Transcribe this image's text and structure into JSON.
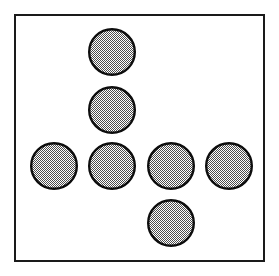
{
  "figure": {
    "title": "Seven shaded circles arranged in a cross pattern",
    "caption": "",
    "width": 279,
    "height": 276,
    "background_color": "#ffffff"
  },
  "frame": {
    "name": "outer-border",
    "x": 14,
    "y": 14,
    "width": 251,
    "height": 248,
    "stroke_color": "#1a1a1a",
    "stroke_width": 2,
    "fill_color": "#ffffff"
  },
  "style": {
    "circle_stroke_color": "#0d0d0d",
    "circle_stroke_width": 2.4,
    "circle_fill_color": "#b8b8b8",
    "circle_fill_pattern": "50-percent-checkerboard-dither",
    "circle_diameter": 48
  },
  "chart_data": {
    "type": "scatter",
    "title": "Seven shaded circles arranged in a cross pattern",
    "xlabel": "",
    "ylabel": "",
    "xlim": [
      0,
      279
    ],
    "ylim": [
      0,
      276
    ],
    "grid": false,
    "legend": "none",
    "marker": "circle",
    "marker_size": 48,
    "marker_fill": "#b8b8b8",
    "marker_edge": "#0d0d0d",
    "points": [
      {
        "id": "circle-1",
        "label": "top",
        "cx": 112,
        "cy": 52,
        "r": 24
      },
      {
        "id": "circle-2",
        "label": "upper-middle",
        "cx": 112,
        "cy": 110,
        "r": 24
      },
      {
        "id": "circle-3",
        "label": "row-left",
        "cx": 54,
        "cy": 166,
        "r": 24
      },
      {
        "id": "circle-4",
        "label": "row-center-left",
        "cx": 112,
        "cy": 166,
        "r": 24
      },
      {
        "id": "circle-5",
        "label": "row-center-right",
        "cx": 171,
        "cy": 166,
        "r": 24
      },
      {
        "id": "circle-6",
        "label": "row-right",
        "cx": 229,
        "cy": 166,
        "r": 24
      },
      {
        "id": "circle-7",
        "label": "bottom",
        "cx": 171,
        "cy": 223,
        "r": 24
      }
    ],
    "counts": {
      "total_circles": 7,
      "rows": 4,
      "columns": 4
    }
  }
}
